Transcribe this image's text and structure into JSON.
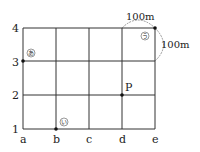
{
  "diagram": {
    "type": "street-grid",
    "columns": [
      "a",
      "b",
      "c",
      "d",
      "e"
    ],
    "rows": [
      "1",
      "2",
      "3",
      "4"
    ],
    "block_size_label_top": "100m",
    "block_size_label_side": "100m",
    "points": {
      "A": {
        "label": "あ",
        "at": "a3"
      },
      "I": {
        "label": "い",
        "at": "b1"
      },
      "U": {
        "label": "う",
        "at": "e4"
      },
      "P": {
        "label": "P",
        "at": "d2"
      }
    }
  }
}
